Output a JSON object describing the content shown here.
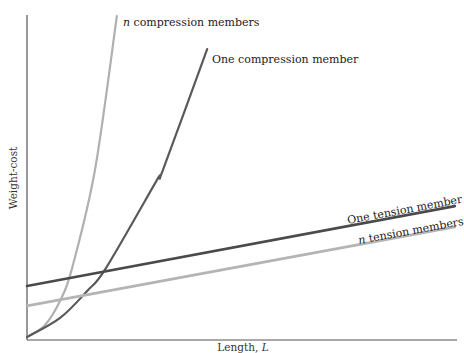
{
  "chart_data": {
    "type": "line",
    "title": "",
    "xlabel": "Length, L",
    "ylabel": "Weight-cost",
    "xlim": [
      0,
      10
    ],
    "ylim": [
      0,
      10
    ],
    "grid": false,
    "ticks": "none",
    "legend": "inline labels",
    "series": [
      {
        "name": "n compression members",
        "label_prefix": "n",
        "label_rest": " compression members",
        "color": "#b0b0b0",
        "width": 2.2,
        "x": [
          0,
          0.42,
          0.79,
          1.05,
          1.58,
          2.09
        ],
        "y": [
          0.09,
          0.46,
          1.26,
          2.22,
          5.23,
          9.97
        ]
      },
      {
        "name": "One compression member",
        "color": "#5a5a5a",
        "width": 2.2,
        "x": [
          0,
          0.77,
          1.4,
          1.84,
          3.02,
          3.16,
          4.19
        ],
        "y": [
          0.09,
          0.68,
          1.51,
          2.22,
          4.92,
          5.23,
          8.95
        ]
      },
      {
        "name": "One tension member",
        "color": "#4a4a4a",
        "width": 2.6,
        "x": [
          0,
          9.95
        ],
        "y": [
          1.66,
          4.12
        ]
      },
      {
        "name": "n tension members",
        "label_prefix": "n",
        "label_rest": " tension members",
        "color": "#b4b4b4",
        "width": 2.6,
        "x": [
          0,
          9.95
        ],
        "y": [
          1.05,
          3.48
        ]
      }
    ]
  },
  "labels": {
    "n_compression_italic": "n",
    "n_compression_rest": " compression members",
    "one_compression": "One compression member",
    "one_tension": "One tension member",
    "n_tension_italic": "n",
    "n_tension_rest": " tension members",
    "xlabel_text": "Length, ",
    "xlabel_var": "L",
    "ylabel": "Weight-cost"
  }
}
